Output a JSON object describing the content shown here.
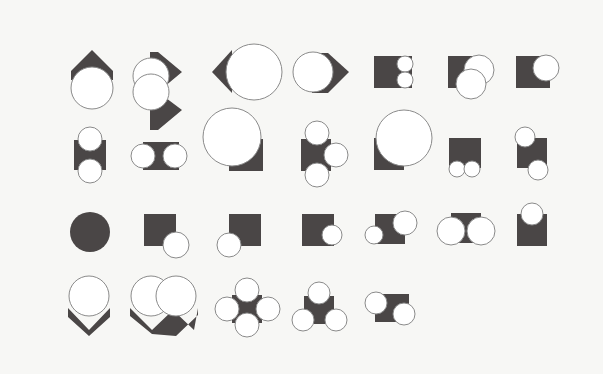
{
  "figure": {
    "background": "#f7f7f5",
    "dark_color": "#4a4646",
    "circle_fill": "#ffffff",
    "circle_stroke": "#8a8a8a",
    "shapes": [
      {
        "id": "r1c1",
        "dark": [
          {
            "type": "poly",
            "points": "92,50 113,71 113,80 71,80 71,71"
          }
        ],
        "circles": [
          [
            92,
            88,
            21
          ]
        ]
      },
      {
        "id": "r1c2",
        "dark": [
          {
            "type": "poly",
            "points": "158,52 182,72 158,92 182,110 158,130 150,130 150,52"
          }
        ],
        "circles": [
          [
            151,
            76,
            18
          ],
          [
            151,
            92,
            18
          ]
        ]
      },
      {
        "id": "r1c3",
        "dark": [
          {
            "type": "poly",
            "points": "232,50 212,72 232,93"
          }
        ],
        "circles": [
          [
            254,
            72,
            28
          ]
        ]
      },
      {
        "id": "r1c4",
        "dark": [
          {
            "type": "poly",
            "points": "328,53 349,72 328,93 312,93 312,53"
          }
        ],
        "circles": [
          [
            313,
            72,
            20
          ]
        ]
      },
      {
        "id": "r1c5",
        "dark": [
          {
            "type": "rect",
            "x": 374,
            "y": 56,
            "w": 38,
            "h": 32
          }
        ],
        "circles": [
          [
            405,
            64,
            8
          ],
          [
            405,
            80,
            8
          ]
        ]
      },
      {
        "id": "r1c6",
        "dark": [
          {
            "type": "rect",
            "x": 448,
            "y": 56,
            "w": 32,
            "h": 32
          }
        ],
        "circles": [
          [
            479,
            70,
            15
          ],
          [
            471,
            84,
            15
          ]
        ]
      },
      {
        "id": "r1c7",
        "dark": [
          {
            "type": "rect",
            "x": 516,
            "y": 56,
            "w": 34,
            "h": 32
          }
        ],
        "circles": [
          [
            546,
            68,
            13
          ]
        ]
      },
      {
        "id": "r2c1",
        "dark": [
          {
            "type": "rect",
            "x": 74,
            "y": 140,
            "w": 32,
            "h": 30
          }
        ],
        "circles": [
          [
            90,
            139,
            12
          ],
          [
            90,
            171,
            12
          ]
        ]
      },
      {
        "id": "r2c2",
        "dark": [
          {
            "type": "rect",
            "x": 143,
            "y": 142,
            "w": 36,
            "h": 28
          }
        ],
        "circles": [
          [
            143,
            156,
            12
          ],
          [
            175,
            156,
            12
          ]
        ]
      },
      {
        "id": "r2c3",
        "dark": [
          {
            "type": "rect",
            "x": 229,
            "y": 139,
            "w": 34,
            "h": 32
          }
        ],
        "circles": [
          [
            232,
            137,
            29
          ]
        ]
      },
      {
        "id": "r2c4",
        "dark": [
          {
            "type": "rect",
            "x": 301,
            "y": 139,
            "w": 30,
            "h": 32
          }
        ],
        "circles": [
          [
            317,
            133,
            12
          ],
          [
            336,
            155,
            12
          ],
          [
            317,
            175,
            12
          ]
        ]
      },
      {
        "id": "r2c5",
        "dark": [
          {
            "type": "rect",
            "x": 374,
            "y": 138,
            "w": 30,
            "h": 32
          }
        ],
        "circles": [
          [
            404,
            138,
            28
          ]
        ]
      },
      {
        "id": "r2c6",
        "dark": [
          {
            "type": "rect",
            "x": 449,
            "y": 138,
            "w": 32,
            "h": 30
          }
        ],
        "circles": [
          [
            457,
            169,
            8
          ],
          [
            472,
            169,
            8
          ]
        ]
      },
      {
        "id": "r2c7",
        "dark": [
          {
            "type": "rect",
            "x": 517,
            "y": 138,
            "w": 30,
            "h": 30
          }
        ],
        "circles": [
          [
            525,
            137,
            10
          ],
          [
            538,
            170,
            10
          ]
        ]
      },
      {
        "id": "r3c1",
        "dark": [
          {
            "type": "circle",
            "cx": 90,
            "cy": 232,
            "r": 20
          }
        ],
        "circles": []
      },
      {
        "id": "r3c2",
        "dark": [
          {
            "type": "rect",
            "x": 144,
            "y": 214,
            "w": 32,
            "h": 32
          }
        ],
        "circles": [
          [
            176,
            245,
            13
          ]
        ]
      },
      {
        "id": "r3c3",
        "dark": [
          {
            "type": "rect",
            "x": 229,
            "y": 214,
            "w": 32,
            "h": 32
          }
        ],
        "circles": [
          [
            229,
            245,
            12
          ]
        ]
      },
      {
        "id": "r3c4",
        "dark": [
          {
            "type": "rect",
            "x": 302,
            "y": 214,
            "w": 32,
            "h": 32
          }
        ],
        "circles": [
          [
            332,
            235,
            10
          ]
        ]
      },
      {
        "id": "r3c5",
        "dark": [
          {
            "type": "rect",
            "x": 375,
            "y": 214,
            "w": 30,
            "h": 30
          }
        ],
        "circles": [
          [
            374,
            235,
            9
          ],
          [
            405,
            223,
            12
          ]
        ]
      },
      {
        "id": "r3c6",
        "dark": [
          {
            "type": "rect",
            "x": 451,
            "y": 213,
            "w": 30,
            "h": 30
          }
        ],
        "circles": [
          [
            451,
            231,
            14
          ],
          [
            481,
            231,
            14
          ]
        ]
      },
      {
        "id": "r3c7",
        "dark": [
          {
            "type": "rect",
            "x": 517,
            "y": 214,
            "w": 30,
            "h": 32
          }
        ],
        "circles": [
          [
            532,
            214,
            11
          ]
        ]
      },
      {
        "id": "r4c1",
        "dark": [
          {
            "type": "poly",
            "points": "68,308 89,330 110,308 110,317 89,336 68,317"
          }
        ],
        "circles": [
          [
            89,
            296,
            20
          ]
        ]
      },
      {
        "id": "r4c2",
        "dark": [
          {
            "type": "poly",
            "points": "130,308 152,330 173,310 194,330 198,308 198,315 176,336 152,334 130,316"
          }
        ],
        "circles": [
          [
            151,
            296,
            20
          ],
          [
            176,
            296,
            20
          ]
        ]
      },
      {
        "id": "r4c3",
        "dark": [
          {
            "type": "rect",
            "x": 232,
            "y": 295,
            "w": 30,
            "h": 28
          }
        ],
        "circles": [
          [
            247,
            290,
            12
          ],
          [
            227,
            309,
            12
          ],
          [
            268,
            309,
            12
          ],
          [
            247,
            325,
            12
          ]
        ]
      },
      {
        "id": "r4c4",
        "dark": [
          {
            "type": "rect",
            "x": 304,
            "y": 296,
            "w": 30,
            "h": 28
          }
        ],
        "circles": [
          [
            319,
            293,
            11
          ],
          [
            303,
            320,
            11
          ],
          [
            336,
            320,
            11
          ]
        ]
      },
      {
        "id": "r4c5",
        "dark": [
          {
            "type": "rect",
            "x": 375,
            "y": 294,
            "w": 34,
            "h": 28
          }
        ],
        "circles": [
          [
            376,
            303,
            11
          ],
          [
            404,
            314,
            11
          ]
        ]
      }
    ]
  }
}
